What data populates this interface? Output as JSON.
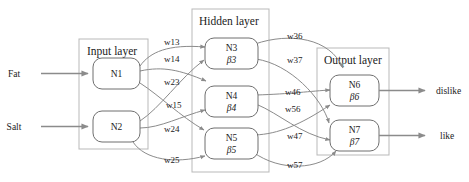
{
  "diagram": {
    "title": "",
    "colors": {
      "background": "#ffffff",
      "layer_border": "#b9b9b9",
      "node_border": "#6f6f6f",
      "edge": "#8b8b8b",
      "text": "#1b1b1b"
    },
    "layers": [
      {
        "id": "input",
        "title": "Input layer",
        "nodes": [
          {
            "id": "n1",
            "label": "N1",
            "beta": ""
          },
          {
            "id": "n2",
            "label": "N2",
            "beta": ""
          }
        ]
      },
      {
        "id": "hidden",
        "title": "Hidden layer",
        "nodes": [
          {
            "id": "n3",
            "label": "N3",
            "beta": "β3"
          },
          {
            "id": "n4",
            "label": "N4",
            "beta": "β4"
          },
          {
            "id": "n5",
            "label": "N5",
            "beta": "β5"
          }
        ]
      },
      {
        "id": "output",
        "title": "Output layer",
        "nodes": [
          {
            "id": "n6",
            "label": "N6",
            "beta": "β6"
          },
          {
            "id": "n7",
            "label": "N7",
            "beta": "β7"
          }
        ]
      }
    ],
    "inputs": [
      {
        "id": "fat",
        "label": "Fat",
        "target": "n1"
      },
      {
        "id": "salt",
        "label": "Salt",
        "target": "n2"
      }
    ],
    "outputs": [
      {
        "id": "dislike",
        "label": "dislike",
        "source": "n6"
      },
      {
        "id": "like",
        "label": "like",
        "source": "n7"
      }
    ],
    "weights": [
      {
        "id": "w13",
        "label": "w13",
        "from": "n1",
        "to": "n3"
      },
      {
        "id": "w14",
        "label": "w14",
        "from": "n1",
        "to": "n4"
      },
      {
        "id": "w23",
        "label": "w23",
        "from": "n2",
        "to": "n3"
      },
      {
        "id": "w15",
        "label": "w15",
        "from": "n1",
        "to": "n5"
      },
      {
        "id": "w24",
        "label": "w24",
        "from": "n2",
        "to": "n4"
      },
      {
        "id": "w25",
        "label": "w25",
        "from": "n2",
        "to": "n5"
      },
      {
        "id": "w36",
        "label": "w36",
        "from": "n3",
        "to": "n6"
      },
      {
        "id": "w37",
        "label": "w37",
        "from": "n3",
        "to": "n7"
      },
      {
        "id": "w46",
        "label": "w46",
        "from": "n4",
        "to": "n6"
      },
      {
        "id": "w56",
        "label": "w56",
        "from": "n5",
        "to": "n6"
      },
      {
        "id": "w47",
        "label": "w47",
        "from": "n4",
        "to": "n7"
      },
      {
        "id": "w57",
        "label": "w57",
        "from": "n5",
        "to": "n7"
      }
    ]
  }
}
